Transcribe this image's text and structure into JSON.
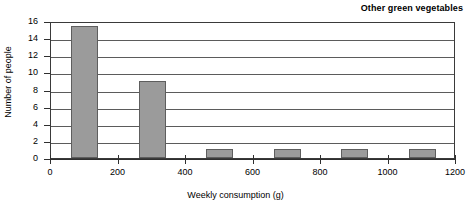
{
  "chart_data": {
    "type": "bar",
    "title": "Other green vegetables",
    "xlabel": "Weekly consumption (g)",
    "ylabel": "Number of people",
    "xlim": [
      0,
      1200
    ],
    "ylim": [
      0,
      16
    ],
    "grid": true,
    "legend": "none",
    "xticks": [
      0,
      200,
      400,
      600,
      800,
      1000,
      1200
    ],
    "yticks": [
      0,
      2,
      4,
      6,
      8,
      10,
      12,
      14,
      16
    ],
    "bar_color": "#9b9b9b",
    "bar_edge_color": "#5e5e5e",
    "bar_width_units": 80,
    "categories": [
      100,
      300,
      500,
      700,
      900,
      1100
    ],
    "values": [
      15.4,
      9,
      1,
      1,
      1,
      1
    ],
    "bars": [
      {
        "label": "100",
        "center": 100,
        "start": 60,
        "end": 140,
        "value": 15.4
      },
      {
        "label": "300",
        "center": 300,
        "start": 260,
        "end": 340,
        "value": 9
      },
      {
        "label": "500",
        "center": 500,
        "start": 460,
        "end": 540,
        "value": 1
      },
      {
        "label": "700",
        "center": 700,
        "start": 660,
        "end": 740,
        "value": 1
      },
      {
        "label": "900",
        "center": 900,
        "start": 860,
        "end": 940,
        "value": 1
      },
      {
        "label": "1100",
        "center": 1100,
        "start": 1060,
        "end": 1140,
        "value": 1
      }
    ]
  }
}
